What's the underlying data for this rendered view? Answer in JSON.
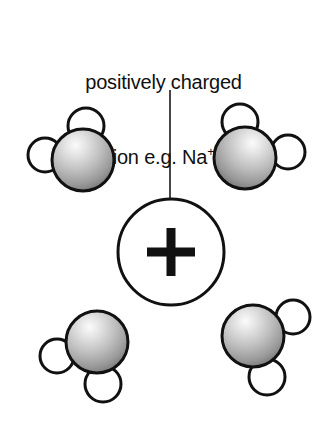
{
  "figure": {
    "background_color": "#ffffff",
    "width": 327,
    "height": 432
  },
  "caption": {
    "line1": "positively charged",
    "line2_prefix": "ion e.g. Na",
    "line2_superscript": "+",
    "text_color": "#111111",
    "font_size_px": 20
  },
  "leader_line": {
    "name": "leader-line",
    "x": 170,
    "y_start": 90,
    "y_end": 216,
    "stroke_color": "#1a1a1a",
    "stroke_width": 1.6
  },
  "ion": {
    "label": "+",
    "charge_sign": "+",
    "center_x": 171,
    "center_y": 252,
    "radius": 53,
    "outline_color": "#111111",
    "outline_width": 3,
    "fill_color": "#ffffff",
    "plus_arm_length": 48,
    "plus_thickness": 9,
    "plus_color": "#111111"
  },
  "colors": {
    "oxygen_highlight": "#f2f2f2",
    "oxygen_mid": "#b8b8b8",
    "oxygen_shadow": "#6e6e6e",
    "hydrogen_fill": "#ffffff",
    "outline": "#111111"
  },
  "water_molecules": [
    {
      "id": "water-top-left",
      "position_label": "top-left",
      "oxygen": {
        "cx": 83,
        "cy": 160,
        "r": 31
      },
      "hydrogens": [
        {
          "id": "hydrogen-top",
          "cx": 86,
          "cy": 126,
          "r": 18
        },
        {
          "id": "hydrogen-left",
          "cx": 45,
          "cy": 155,
          "r": 17
        }
      ]
    },
    {
      "id": "water-top-right",
      "position_label": "top-right",
      "oxygen": {
        "cx": 245,
        "cy": 158,
        "r": 31
      },
      "hydrogens": [
        {
          "id": "hydrogen-top",
          "cx": 240,
          "cy": 122,
          "r": 18
        },
        {
          "id": "hydrogen-right",
          "cx": 288,
          "cy": 152,
          "r": 17
        }
      ]
    },
    {
      "id": "water-bottom-left",
      "position_label": "bottom-left",
      "oxygen": {
        "cx": 97,
        "cy": 342,
        "r": 31
      },
      "hydrogens": [
        {
          "id": "hydrogen-left",
          "cx": 57,
          "cy": 356,
          "r": 17
        },
        {
          "id": "hydrogen-bottom-right",
          "cx": 103,
          "cy": 384,
          "r": 18
        }
      ]
    },
    {
      "id": "water-bottom-right",
      "position_label": "bottom-right",
      "oxygen": {
        "cx": 253,
        "cy": 336,
        "r": 31
      },
      "hydrogens": [
        {
          "id": "hydrogen-top-right",
          "cx": 293,
          "cy": 317,
          "r": 17
        },
        {
          "id": "hydrogen-bottom",
          "cx": 267,
          "cy": 377,
          "r": 18
        }
      ]
    }
  ]
}
